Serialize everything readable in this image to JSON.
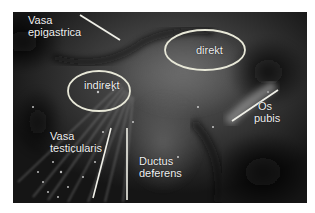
{
  "figure": {
    "type": "surgical-photo-annotated",
    "labels": {
      "vasa_epigastrica_1": "Vasa",
      "vasa_epigastrica_2": "epigastrica",
      "indirekt": "indirekt",
      "direkt": "direkt",
      "os_pubis_1": "Os",
      "os_pubis_2": "pubis",
      "vasa_testicularis_1": "Vasa",
      "vasa_testicularis_2": "testicularis",
      "ductus_deferens_1": "Ductus",
      "ductus_deferens_2": "deferens"
    },
    "colors": {
      "annotation": "#f0f0e8",
      "ellipse_stroke": "#e8e8d8",
      "background": "#ffffff"
    }
  }
}
